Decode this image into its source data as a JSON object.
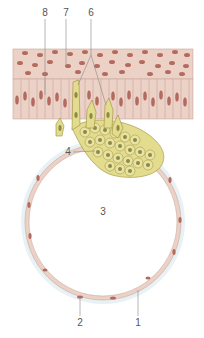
{
  "figure": {
    "labels": [
      {
        "id": "8",
        "text": "8",
        "x": 45,
        "y": 13
      },
      {
        "id": "7",
        "text": "7",
        "x": 66,
        "y": 13
      },
      {
        "id": "6",
        "text": "6",
        "x": 91,
        "y": 13
      },
      {
        "id": "4",
        "text": "4",
        "x": 68,
        "y": 152
      },
      {
        "id": "3",
        "text": "3",
        "x": 103,
        "y": 212
      },
      {
        "id": "2",
        "text": "2",
        "x": 80,
        "y": 323
      },
      {
        "id": "1",
        "text": "1",
        "x": 138,
        "y": 323
      }
    ],
    "colors": {
      "tissue_pink": "#ecd1c6",
      "tissue_outline": "#c9a79a",
      "nucleus": "#b46a5e",
      "yellow_cell": "#e3dc8e",
      "yellow_outline": "#9a8f3a",
      "yellow_nucleus": "#8c8a48",
      "label_line": "#888888",
      "vesicle_halo": "#e8f2f6"
    }
  }
}
